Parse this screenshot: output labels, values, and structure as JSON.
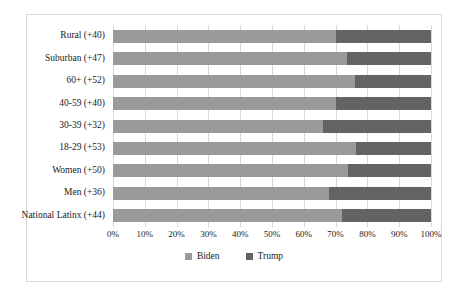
{
  "chart_data": {
    "type": "bar",
    "orientation": "horizontal",
    "stacked": true,
    "normalized": "100%",
    "title": "",
    "xlabel": "",
    "ylabel": "",
    "xlim": [
      0,
      100
    ],
    "grid": true,
    "legend_position": "bottom",
    "categories": [
      "Rural (+40)",
      "Suburban (+47)",
      "60+ (+52)",
      "40-59 (+40)",
      "30-39 (+32)",
      "18-29 (+53)",
      "Women (+50)",
      "Men (+36)",
      "National Latinx (+44)"
    ],
    "series": [
      {
        "name": "Biden",
        "color": "#9a9a9a",
        "values": [
          70,
          73.5,
          76,
          70,
          66,
          76.5,
          74,
          68,
          72
        ]
      },
      {
        "name": "Trump",
        "color": "#636363",
        "values": [
          30,
          26.5,
          24,
          30,
          34,
          23.5,
          26,
          32,
          28
        ]
      }
    ],
    "xticks": [
      {
        "value": 0,
        "label": "0%"
      },
      {
        "value": 10,
        "label": "10%"
      },
      {
        "value": 20,
        "label": "20%"
      },
      {
        "value": 30,
        "label": "30%"
      },
      {
        "value": 40,
        "label": "40%"
      },
      {
        "value": 50,
        "label": "50%"
      },
      {
        "value": 60,
        "label": "60%"
      },
      {
        "value": 70,
        "label": "70%"
      },
      {
        "value": 80,
        "label": "80%"
      },
      {
        "value": 90,
        "label": "90%"
      },
      {
        "value": 100,
        "label": "100%"
      }
    ],
    "legend": [
      {
        "label": "Biden",
        "color": "#9a9a9a"
      },
      {
        "label": "Trump",
        "color": "#636363"
      }
    ]
  }
}
